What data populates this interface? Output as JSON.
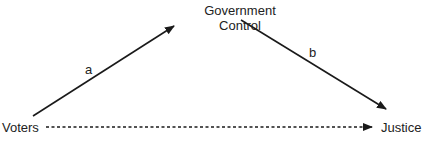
{
  "diagram": {
    "type": "mediation-path-diagram",
    "nodes": {
      "government": {
        "line1": "Government",
        "line2": "Control"
      },
      "voters": {
        "label": "Voters"
      },
      "justice": {
        "label": "Justice"
      }
    },
    "edges": [
      {
        "from": "Voters",
        "to": "Government Control",
        "label": "a",
        "style": "solid"
      },
      {
        "from": "Government Control",
        "to": "Justice",
        "label": "b",
        "style": "solid"
      },
      {
        "from": "Voters",
        "to": "Justice",
        "label": "",
        "style": "dashed"
      }
    ],
    "colors": {
      "line": "#1a1a1a",
      "text": "#222222",
      "background": "#ffffff"
    }
  }
}
